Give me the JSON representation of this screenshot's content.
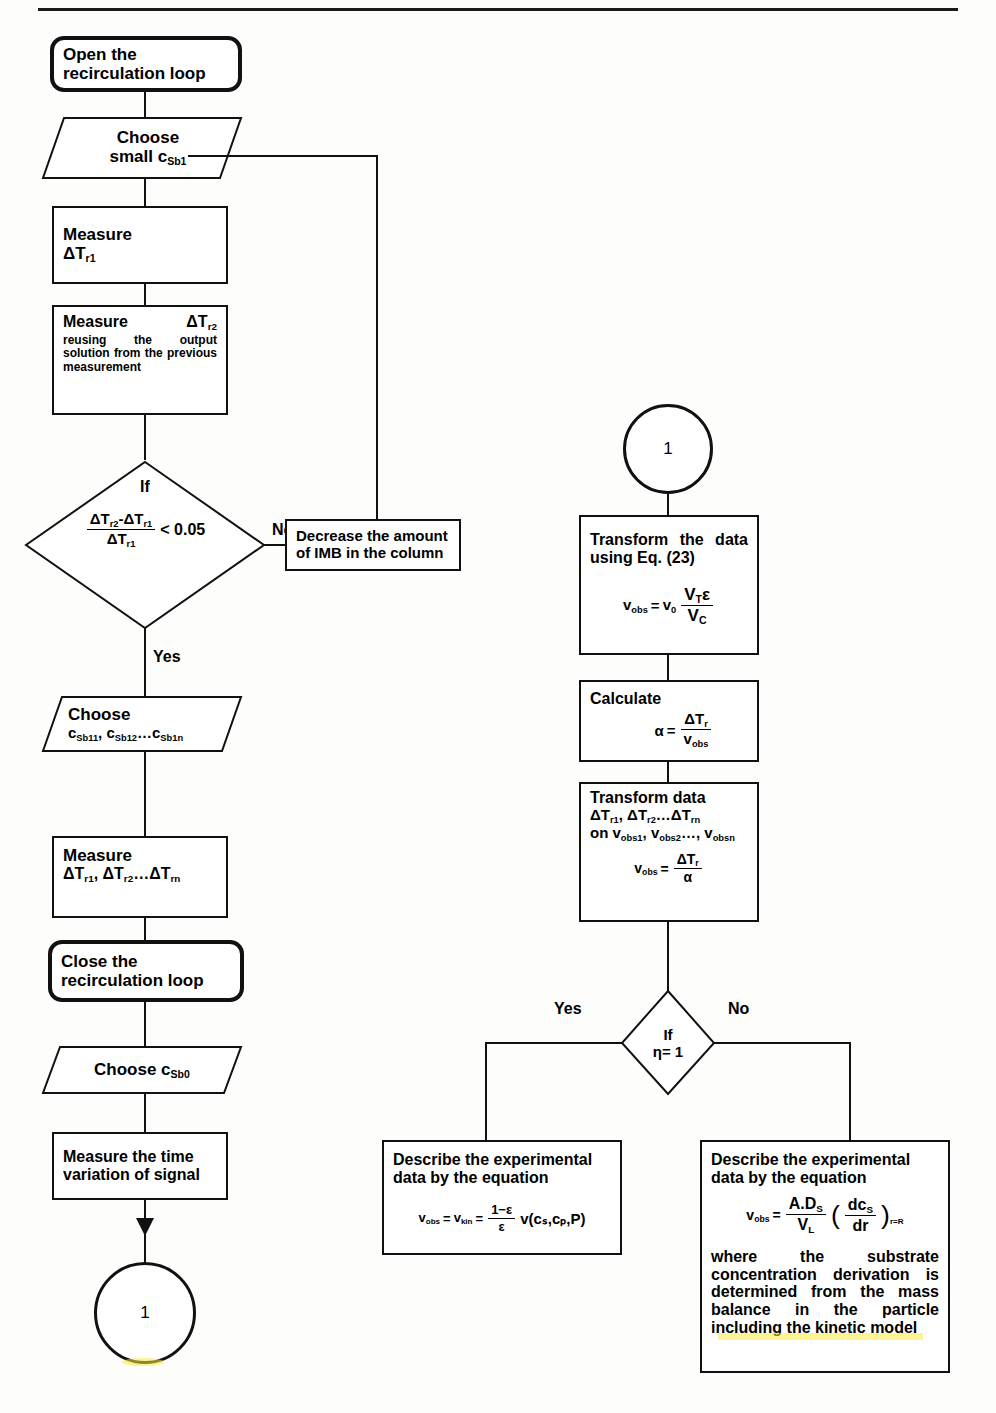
{
  "diagram": {
    "type": "flowchart",
    "title_rule": true,
    "nodes": {
      "open_loop": {
        "label_line1": "Open the",
        "label_line2": "recirculation loop",
        "shape": "terminator"
      },
      "choose_small": {
        "label_line1": "Choose",
        "label_line2_pre": "small c",
        "label_line2_sub": "Sb1",
        "shape": "parallelogram"
      },
      "measure_t1": {
        "label_line1": "Measure",
        "label_line2_pre": "ΔT",
        "label_line2_sub": "r1",
        "shape": "process"
      },
      "measure_t2": {
        "head_pre": "Measure",
        "head_sym": "ΔT",
        "head_sub": "r2",
        "body": "reusing the output solution from the previous measurement",
        "shape": "process"
      },
      "decision_ratio": {
        "label_if": "If",
        "num_a": "ΔT",
        "num_a_sub": "r2",
        "num_b": "ΔT",
        "num_b_sub": "r1",
        "den": "ΔT",
        "den_sub": "r1",
        "comparison": "< 0.05",
        "shape": "decision"
      },
      "decrease_imb": {
        "line1": "Decrease the amount",
        "line2": "of IMB in the column",
        "shape": "process"
      },
      "choose_series": {
        "label_line1": "Choose",
        "c1": "c",
        "c1_sub": "Sb11",
        "c2": "c",
        "c2_sub": "Sb12",
        "ellipsis": "…",
        "c3": "c",
        "c3_sub": "Sb1n",
        "shape": "parallelogram"
      },
      "measure_series": {
        "label_line1": "Measure",
        "s1": "ΔT",
        "s1_sub": "r1",
        "s2": "ΔT",
        "s2_sub": "r2",
        "ellipsis": "…",
        "s3": "ΔT",
        "s3_sub": "rn",
        "shape": "process"
      },
      "close_loop": {
        "label_line1": "Close the",
        "label_line2": "recirculation loop",
        "shape": "terminator"
      },
      "choose_sb0": {
        "label_pre": "Choose c",
        "label_sub": "Sb0",
        "shape": "parallelogram"
      },
      "measure_time": {
        "line1": "Measure the time",
        "line2": "variation of signal",
        "shape": "process"
      },
      "connector_bottom_left": {
        "label": "1",
        "shape": "connector"
      },
      "connector_top_right": {
        "label": "1",
        "shape": "connector"
      },
      "transform_eq23": {
        "text": "Transform the data using Eq. (23)",
        "eq_lhs": "v",
        "eq_lhs_sub": "obs",
        "eq_mid": "v",
        "eq_mid_sub": "0",
        "frac_num_v": "V",
        "frac_num_v_sub": "T",
        "frac_num_eps": "ε",
        "frac_den_v": "V",
        "frac_den_v_sub": "C",
        "shape": "process"
      },
      "calculate_alpha": {
        "label": "Calculate",
        "alpha": "α",
        "eq": "=",
        "num": "ΔT",
        "num_sub": "r",
        "den": "v",
        "den_sub": "obs",
        "shape": "process"
      },
      "transform_data": {
        "line1": "Transform data",
        "l2_a": "ΔT",
        "l2_a_sub": "r1",
        "l2_b": "ΔT",
        "l2_b_sub": "r2",
        "l2_ell": "…",
        "l2_c": "ΔT",
        "l2_c_sub": "rn",
        "l3_on": "on",
        "l3_a": "v",
        "l3_a_sub": "obs1",
        "l3_b": "v",
        "l3_b_sub": "obs2",
        "l3_ell": "…",
        "l3_c": "v",
        "l3_c_sub": "obsn",
        "eq_lhs": "v",
        "eq_lhs_sub": "obs",
        "eq_num": "ΔT",
        "eq_num_sub": "r",
        "eq_den": "α",
        "shape": "process"
      },
      "decision_eta": {
        "label_if": "If",
        "label_cond": "η= 1",
        "shape": "decision"
      },
      "describe_kin": {
        "line1": "Describe the experimental",
        "line2": "data by the equation",
        "eq_lhs": "v",
        "eq_lhs_sub": "obs",
        "eq_mid": "v",
        "eq_mid_sub": "kin",
        "frac_num": "1−ε",
        "frac_den": "ε",
        "eq_tail_v": "v",
        "eq_tail_args": "(cₛ,cₚ,P)",
        "shape": "process"
      },
      "describe_diff": {
        "line1": "Describe the experimental",
        "line2": "data by the equation",
        "eq_lhs": "v",
        "eq_lhs_sub": "obs",
        "frac_num_a": "A.D",
        "frac_num_a_sub": "S",
        "frac_den_v": "V",
        "frac_den_v_sub": "L",
        "inner_num": "dc",
        "inner_num_sub": "S",
        "inner_den": "dr",
        "inner_sub": "r=R",
        "note": "where the substrate concentration derivation is determined from the mass balance in the particle including the kinetic model",
        "shape": "process"
      }
    },
    "edge_labels": {
      "no_top": "No",
      "yes_top": "Yes",
      "yes_bottom": "Yes",
      "no_bottom": "No"
    },
    "colors": {
      "stroke": "#111111",
      "fill": "#ffffff",
      "page": "#fdfdfb",
      "highlight": "#f7e93c"
    }
  }
}
